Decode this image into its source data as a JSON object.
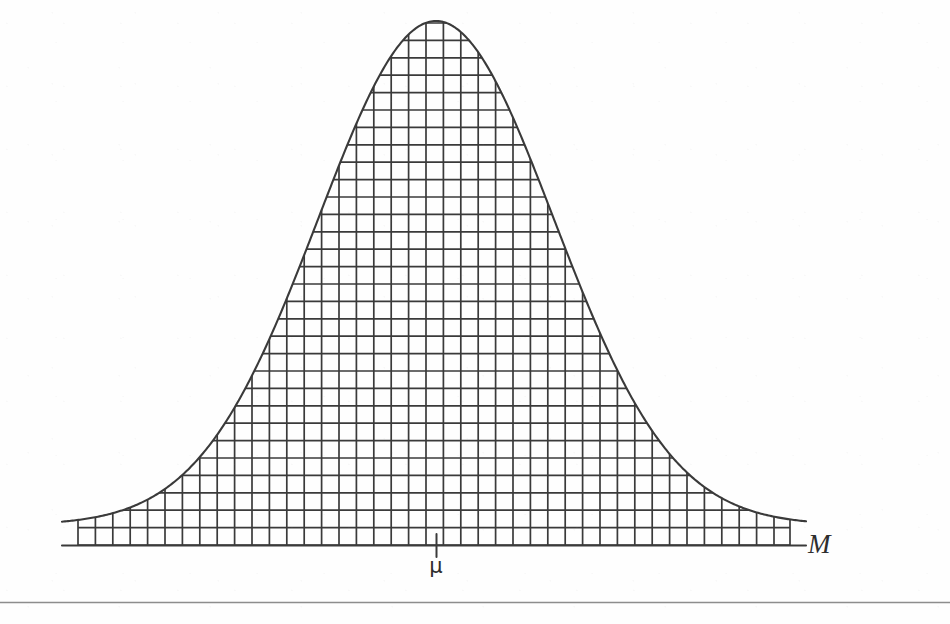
{
  "figure": {
    "background_color": "#fefefe",
    "ink_color": "#3a3a3a",
    "axis_label": "M",
    "mean_tick_label": "μ",
    "baseline_rule_present": true
  },
  "chart_data": {
    "type": "area",
    "subtitle": "",
    "xlabel": "M",
    "ylabel": "",
    "grid": true,
    "legend": null,
    "annotations": [
      {
        "text": "μ",
        "x": 436,
        "y": 562,
        "meaning": "mean-marker"
      },
      {
        "text": "M",
        "x": 808,
        "y": 552,
        "meaning": "axis-variable-label"
      }
    ],
    "axis": {
      "baseline_y": 545,
      "x_start": 62,
      "x_end": 806,
      "tick_x": 436,
      "tick_top_y": 535,
      "tick_bottom_y": 557
    },
    "hatch": {
      "cell_width": 17.4,
      "cell_height": 17.4,
      "x_left": 78,
      "x_right": 790,
      "columns": 41,
      "rows": 31,
      "description": "square grid clipped to the region under the curve"
    },
    "curve": {
      "distribution": "gaussian",
      "peak_x": 436,
      "peak_y": 21,
      "amplitude_px": 524,
      "sigma_px": 118,
      "baseline_offset_px": 20,
      "x_domain": [
        62,
        806
      ]
    },
    "x": [
      62,
      79,
      96,
      114,
      131,
      148,
      166,
      183,
      200,
      218,
      235,
      253,
      270,
      287,
      305,
      322,
      340,
      357,
      374,
      392,
      409,
      427,
      436,
      444,
      462,
      479,
      496,
      514,
      531,
      549,
      566,
      583,
      601,
      618,
      636,
      653,
      670,
      688,
      705,
      723,
      740,
      757,
      775,
      790,
      806
    ],
    "values": [
      0.4,
      1.0,
      1.8,
      3.0,
      4.8,
      7.3,
      10.8,
      15.4,
      21.2,
      28.3,
      36.7,
      46.1,
      56.2,
      66.5,
      76.3,
      85.0,
      91.9,
      96.5,
      99.1,
      100.0,
      99.5,
      97.6,
      96.5,
      95.2,
      90.4,
      84.0,
      76.3,
      67.4,
      57.8,
      48.0,
      38.6,
      30.0,
      22.4,
      16.2,
      11.3,
      7.6,
      4.9,
      3.1,
      1.9,
      1.1,
      0.6,
      0.3,
      0.2,
      0.1,
      0.0
    ],
    "ylim": [
      0,
      100
    ],
    "xlim": [
      62,
      806
    ]
  }
}
